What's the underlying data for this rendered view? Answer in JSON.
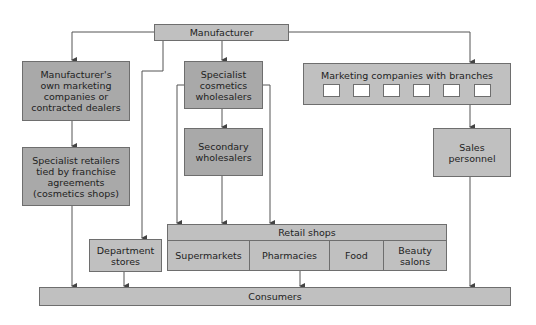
{
  "diagram": {
    "nodes": {
      "manufacturer": "Manufacturer",
      "own_marketing": [
        "Manufacturer's",
        "own marketing",
        "companies or",
        "contracted dealers"
      ],
      "specialist_retailers": [
        "Specialist retailers",
        "tied by franchise",
        "agreements",
        "(cosmetics shops)"
      ],
      "specialist_wholesalers": [
        "Specialist",
        "cosmetics",
        "wholesalers"
      ],
      "secondary_wholesalers": [
        "Secondary",
        "wholesalers"
      ],
      "marketing_companies": "Marketing companies with branches",
      "branch_count": 6,
      "sales_personnel": [
        "Sales",
        "personnel"
      ],
      "department_stores": [
        "Department",
        "stores"
      ],
      "retail_shops": "Retail shops",
      "retail_types": {
        "supermarkets": "Supermarkets",
        "pharmacies": "Pharmacies",
        "food": "Food",
        "beauty_salons": [
          "Beauty",
          "salons"
        ]
      },
      "consumers": "Consumers"
    },
    "edges": [
      [
        "Manufacturer",
        "Manufacturer's own marketing companies or contracted dealers"
      ],
      [
        "Manufacturer",
        "Department stores"
      ],
      [
        "Manufacturer",
        "Specialist cosmetics wholesalers"
      ],
      [
        "Manufacturer",
        "Marketing companies with branches"
      ],
      [
        "Manufacturer's own marketing companies or contracted dealers",
        "Specialist retailers tied by franchise agreements (cosmetics shops)"
      ],
      [
        "Specialist retailers tied by franchise agreements (cosmetics shops)",
        "Consumers"
      ],
      [
        "Specialist cosmetics wholesalers",
        "Secondary wholesalers"
      ],
      [
        "Specialist cosmetics wholesalers",
        "Retail shops"
      ],
      [
        "Secondary wholesalers",
        "Retail shops"
      ],
      [
        "Department stores",
        "Consumers"
      ],
      [
        "Retail shops",
        "Consumers"
      ],
      [
        "Marketing companies with branches",
        "Sales personnel"
      ],
      [
        "Sales personnel",
        "Consumers"
      ]
    ],
    "colors": {
      "box_fill": "#c0c0c0",
      "box_fill_dark": "#a9a9a9",
      "line": "#555555"
    }
  }
}
